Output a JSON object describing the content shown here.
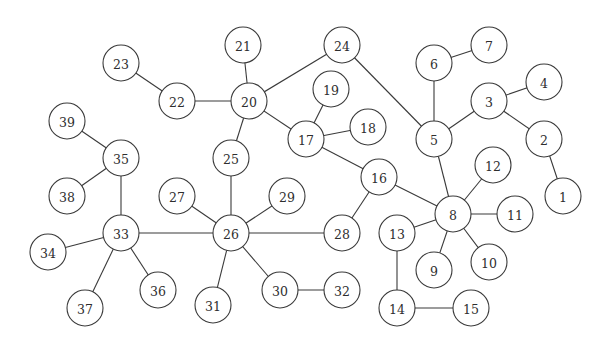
{
  "diagram": {
    "type": "tree-graph",
    "node_radius": 18,
    "colors": {
      "stroke": "#3a3a3a",
      "fill": "#ffffff",
      "text": "#2e2e2e",
      "background": "#ffffff"
    },
    "nodes": [
      {
        "id": "1",
        "x": 563,
        "y": 196
      },
      {
        "id": "2",
        "x": 544,
        "y": 139
      },
      {
        "id": "3",
        "x": 489,
        "y": 101
      },
      {
        "id": "4",
        "x": 544,
        "y": 82
      },
      {
        "id": "5",
        "x": 434,
        "y": 139
      },
      {
        "id": "6",
        "x": 434,
        "y": 63
      },
      {
        "id": "7",
        "x": 489,
        "y": 45
      },
      {
        "id": "8",
        "x": 453,
        "y": 214
      },
      {
        "id": "9",
        "x": 434,
        "y": 270
      },
      {
        "id": "10",
        "x": 489,
        "y": 262
      },
      {
        "id": "11",
        "x": 515,
        "y": 214
      },
      {
        "id": "12",
        "x": 493,
        "y": 165
      },
      {
        "id": "13",
        "x": 397,
        "y": 233
      },
      {
        "id": "14",
        "x": 397,
        "y": 308
      },
      {
        "id": "15",
        "x": 471,
        "y": 308
      },
      {
        "id": "16",
        "x": 379,
        "y": 177
      },
      {
        "id": "17",
        "x": 306,
        "y": 139
      },
      {
        "id": "18",
        "x": 368,
        "y": 127
      },
      {
        "id": "19",
        "x": 331,
        "y": 89
      },
      {
        "id": "20",
        "x": 249,
        "y": 101
      },
      {
        "id": "21",
        "x": 243,
        "y": 45
      },
      {
        "id": "22",
        "x": 177,
        "y": 101
      },
      {
        "id": "23",
        "x": 121,
        "y": 63
      },
      {
        "id": "24",
        "x": 342,
        "y": 45
      },
      {
        "id": "25",
        "x": 231,
        "y": 158
      },
      {
        "id": "26",
        "x": 231,
        "y": 233
      },
      {
        "id": "27",
        "x": 177,
        "y": 196
      },
      {
        "id": "28",
        "x": 342,
        "y": 233
      },
      {
        "id": "29",
        "x": 287,
        "y": 196
      },
      {
        "id": "30",
        "x": 280,
        "y": 290
      },
      {
        "id": "31",
        "x": 213,
        "y": 305
      },
      {
        "id": "32",
        "x": 342,
        "y": 290
      },
      {
        "id": "33",
        "x": 121,
        "y": 233
      },
      {
        "id": "34",
        "x": 48,
        "y": 252
      },
      {
        "id": "35",
        "x": 121,
        "y": 158
      },
      {
        "id": "36",
        "x": 158,
        "y": 290
      },
      {
        "id": "37",
        "x": 85,
        "y": 308
      },
      {
        "id": "38",
        "x": 67,
        "y": 196
      },
      {
        "id": "39",
        "x": 67,
        "y": 121
      }
    ],
    "edges": [
      [
        "23",
        "22"
      ],
      [
        "22",
        "20"
      ],
      [
        "21",
        "20"
      ],
      [
        "20",
        "24"
      ],
      [
        "20",
        "17"
      ],
      [
        "20",
        "25"
      ],
      [
        "24",
        "5"
      ],
      [
        "19",
        "17"
      ],
      [
        "17",
        "18"
      ],
      [
        "17",
        "16"
      ],
      [
        "6",
        "7"
      ],
      [
        "6",
        "5"
      ],
      [
        "5",
        "3"
      ],
      [
        "3",
        "4"
      ],
      [
        "3",
        "2"
      ],
      [
        "2",
        "1"
      ],
      [
        "5",
        "8"
      ],
      [
        "16",
        "8"
      ],
      [
        "16",
        "28"
      ],
      [
        "12",
        "8"
      ],
      [
        "8",
        "11"
      ],
      [
        "8",
        "13"
      ],
      [
        "8",
        "9"
      ],
      [
        "8",
        "10"
      ],
      [
        "13",
        "14"
      ],
      [
        "14",
        "15"
      ],
      [
        "39",
        "35"
      ],
      [
        "35",
        "38"
      ],
      [
        "35",
        "33"
      ],
      [
        "33",
        "34"
      ],
      [
        "33",
        "37"
      ],
      [
        "33",
        "36"
      ],
      [
        "33",
        "26"
      ],
      [
        "25",
        "26"
      ],
      [
        "27",
        "26"
      ],
      [
        "29",
        "26"
      ],
      [
        "26",
        "28"
      ],
      [
        "26",
        "31"
      ],
      [
        "26",
        "30"
      ],
      [
        "30",
        "32"
      ]
    ]
  }
}
